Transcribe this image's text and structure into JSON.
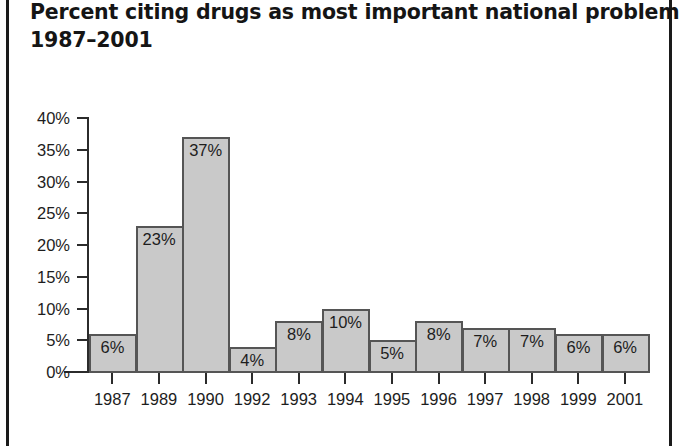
{
  "title": {
    "line1": "Percent citing drugs as most important national problem,",
    "line2": "1987–2001"
  },
  "chart_data": {
    "type": "bar",
    "title": "Percent citing drugs as most important national problem, 1987–2001",
    "xlabel": "",
    "ylabel": "",
    "categories": [
      "1987",
      "1989",
      "1990",
      "1992",
      "1993",
      "1994",
      "1995",
      "1996",
      "1997",
      "1998",
      "1999",
      "2001"
    ],
    "values": [
      6,
      23,
      37,
      4,
      8,
      10,
      5,
      8,
      7,
      7,
      6,
      6
    ],
    "value_labels": [
      "6%",
      "23%",
      "37%",
      "4%",
      "8%",
      "10%",
      "5%",
      "8%",
      "7%",
      "7%",
      "6%",
      "6%"
    ],
    "ylim": [
      0,
      40
    ],
    "ytick_values": [
      0,
      5,
      10,
      15,
      20,
      25,
      30,
      35,
      40
    ],
    "ytick_labels": [
      "0%",
      "5%",
      "10%",
      "15%",
      "20%",
      "25%",
      "30%",
      "35%",
      "40%"
    ],
    "grid": false,
    "legend": false,
    "bar_fill_color": "#c9c9c9",
    "bar_border_color": "#555555",
    "axis_color": "#2b2b2b",
    "text_color": "#1d1d1d"
  }
}
